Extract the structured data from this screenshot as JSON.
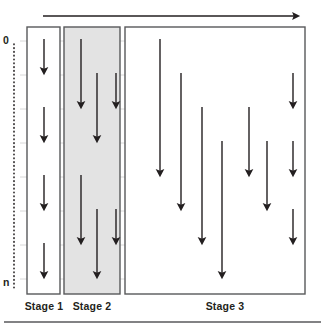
{
  "figure": {
    "top_axis": {
      "name": "time-axis-arrow",
      "direction": "left-to-right",
      "x_start": 43,
      "x_end": 296,
      "y": 16
    },
    "vertical_axis": {
      "name": "index-axis",
      "style": "dotted",
      "x": 14,
      "y_start": 44,
      "y_end": 290,
      "top_label": "0",
      "bottom_label": "n"
    },
    "gridlines": {
      "color": "#d8d8d8",
      "x_start": 20,
      "x_end": 305,
      "y_values": [
        41,
        75,
        109,
        143,
        177,
        211,
        245,
        279
      ]
    },
    "stages": [
      {
        "label": "Stage 1",
        "label_x": 44,
        "label_y": 300,
        "x": 27,
        "y": 27,
        "width": 33,
        "height": 267,
        "fill": "#ffffff",
        "stroke": "#58595b",
        "arrows": [
          {
            "x": 44,
            "y1": 39,
            "y2": 71
          },
          {
            "x": 44,
            "y1": 107,
            "y2": 139
          },
          {
            "x": 44,
            "y1": 175,
            "y2": 207
          },
          {
            "x": 44,
            "y1": 243,
            "y2": 275
          }
        ]
      },
      {
        "label": "Stage 2",
        "label_x": 92,
        "label_y": 300,
        "x": 64,
        "y": 27,
        "width": 56,
        "height": 267,
        "fill": "#e3e3e3",
        "stroke": "#58595b",
        "arrows": [
          {
            "x": 81,
            "y1": 39,
            "y2": 105
          },
          {
            "x": 97,
            "y1": 73,
            "y2": 139
          },
          {
            "x": 116,
            "y1": 73,
            "y2": 105
          },
          {
            "x": 81,
            "y1": 175,
            "y2": 241
          },
          {
            "x": 97,
            "y1": 209,
            "y2": 275
          },
          {
            "x": 116,
            "y1": 209,
            "y2": 241
          }
        ]
      },
      {
        "label": "Stage 3",
        "label_x": 225,
        "label_y": 300,
        "x": 125,
        "y": 27,
        "width": 180,
        "height": 267,
        "fill": "#ffffff",
        "stroke": "#58595b",
        "arrows": [
          {
            "x": 160,
            "y1": 39,
            "y2": 173
          },
          {
            "x": 181,
            "y1": 73,
            "y2": 207
          },
          {
            "x": 202,
            "y1": 107,
            "y2": 241
          },
          {
            "x": 222,
            "y1": 141,
            "y2": 275
          },
          {
            "x": 249,
            "y1": 107,
            "y2": 173
          },
          {
            "x": 267,
            "y1": 141,
            "y2": 207
          },
          {
            "x": 293,
            "y1": 73,
            "y2": 105
          },
          {
            "x": 293,
            "y1": 141,
            "y2": 173
          },
          {
            "x": 293,
            "y1": 209,
            "y2": 241
          }
        ]
      }
    ],
    "footer_rule": {
      "name": "footer-divider",
      "x_start": 4,
      "x_end": 321,
      "y": 322,
      "color": "#58595b"
    },
    "colors": {
      "ink": "#231f20",
      "arrow": "#231f20",
      "grid": "#d8d8d8",
      "box_stroke": "#58595b",
      "stage2_fill": "#e3e3e3"
    }
  },
  "chart_data": {
    "type": "diagram",
    "xlabel": "time",
    "ylabel": "0 .. n",
    "categories": [
      "Stage 1",
      "Stage 2",
      "Stage 3"
    ],
    "values": [
      4,
      6,
      9
    ]
  }
}
